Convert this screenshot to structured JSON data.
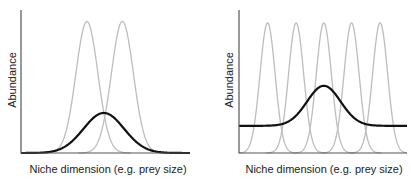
{
  "chart_data": [
    {
      "type": "line",
      "title": "",
      "xlabel": "Niche dimension (e.g. prey size)",
      "ylabel": "Abundance",
      "grid": false,
      "legend": null,
      "description": "Two narrow specialist niche curves (grey) and a broad generalist resource distribution (black) peaking between them",
      "series": [
        {
          "name": "specialist-1",
          "color": "#bdbdbd",
          "kind": "gaussian",
          "center": 0.39,
          "height": 0.92,
          "width": 0.065
        },
        {
          "name": "specialist-2",
          "color": "#bdbdbd",
          "kind": "gaussian",
          "center": 0.6,
          "height": 0.92,
          "width": 0.065
        },
        {
          "name": "resource",
          "color": "#111111",
          "kind": "gaussian",
          "center": 0.49,
          "height": 0.28,
          "width": 0.12,
          "baseline": 0.0
        }
      ],
      "xlim": [
        0,
        1
      ],
      "ylim": [
        0,
        1
      ]
    },
    {
      "type": "line",
      "title": "",
      "xlabel": "Niche dimension (e.g. prey size)",
      "ylabel": "Abundance",
      "grid": false,
      "legend": null,
      "description": "Five evenly spaced specialist niche curves (grey) over a resource distribution (black) with a raised baseline and central peak",
      "series": [
        {
          "name": "specialist-1",
          "color": "#bdbdbd",
          "kind": "gaussian",
          "center": 0.17,
          "height": 0.91,
          "width": 0.045
        },
        {
          "name": "specialist-2",
          "color": "#bdbdbd",
          "kind": "gaussian",
          "center": 0.34,
          "height": 0.91,
          "width": 0.045
        },
        {
          "name": "specialist-3",
          "color": "#bdbdbd",
          "kind": "gaussian",
          "center": 0.505,
          "height": 0.91,
          "width": 0.045
        },
        {
          "name": "specialist-4",
          "color": "#bdbdbd",
          "kind": "gaussian",
          "center": 0.67,
          "height": 0.91,
          "width": 0.045
        },
        {
          "name": "specialist-5",
          "color": "#bdbdbd",
          "kind": "gaussian",
          "center": 0.84,
          "height": 0.91,
          "width": 0.045
        },
        {
          "name": "resource",
          "color": "#111111",
          "kind": "gaussian",
          "center": 0.505,
          "height": 0.28,
          "width": 0.1,
          "baseline": 0.19
        }
      ],
      "xlim": [
        0,
        1
      ],
      "ylim": [
        0,
        1
      ]
    }
  ],
  "panels": [
    {
      "ylabel": "Abundance",
      "xlabel": "Niche dimension (e.g. prey size)"
    },
    {
      "ylabel": "Abundance",
      "xlabel": "Niche dimension (e.g. prey size)"
    }
  ],
  "colors": {
    "axis": "#555555",
    "specialist": "#bdbdbd",
    "resource": "#111111"
  }
}
